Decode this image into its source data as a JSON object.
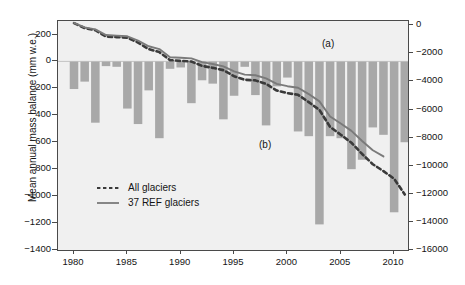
{
  "figure": {
    "background": "#ffffff",
    "plot_background": "#f0f0f0",
    "frame_color": "#4a4a4a"
  },
  "annotations": {
    "panel_a": "(a)",
    "panel_b": "(b)"
  },
  "legend": {
    "items": [
      {
        "label": "All glaciers",
        "style": "dashed",
        "color": "#3a3a3a"
      },
      {
        "label": "37 REF glaciers",
        "style": "solid",
        "color": "#7a7a7a"
      }
    ]
  },
  "chart_data": {
    "type": "bar",
    "title": "",
    "subtitle": "",
    "xlabel": "",
    "ylabel": "Mean annual mass balance (mm w.e.)",
    "y2label": "Cumulative annual mass balance (mm w.e.)",
    "xlim": [
      1979.0,
      2011.8
    ],
    "ylim": [
      -1400,
      300
    ],
    "y2lim": [
      -16000,
      300
    ],
    "grid": false,
    "legend_position": "center-left",
    "bar_color": "#a8a8a8",
    "xticks": [
      1980,
      1985,
      1990,
      1995,
      2000,
      2005,
      2010
    ],
    "xticklabels": [
      "1980",
      "1985",
      "1990",
      "1995",
      "2000",
      "2005",
      "2010"
    ],
    "yticks": [
      200,
      0,
      -200,
      -400,
      -600,
      -800,
      -1000,
      -1200,
      -1400
    ],
    "yticklabels": [
      "200",
      "0",
      "-200",
      "-400",
      "-600",
      "-800",
      "-1000",
      "-1200",
      "-1400"
    ],
    "y2ticks": [
      0,
      -2000,
      -4000,
      -6000,
      -8000,
      -10000,
      -12000,
      -14000,
      -16000
    ],
    "y2ticklabels": [
      "0",
      "-2000",
      "-4000",
      "-6000",
      "-8000",
      "-10000",
      "-12000",
      "-14000",
      "-16000"
    ],
    "categories": [
      1980,
      1981,
      1982,
      1983,
      1984,
      1985,
      1986,
      1987,
      1988,
      1989,
      1990,
      1991,
      1992,
      1993,
      1994,
      1995,
      1996,
      1997,
      1998,
      1999,
      2000,
      2001,
      2002,
      2003,
      2004,
      2005,
      2006,
      2007,
      2008,
      2009,
      2010,
      2011
    ],
    "values": [
      -205,
      -150,
      -455,
      -35,
      -40,
      -350,
      -465,
      -215,
      -570,
      -55,
      -45,
      -310,
      -140,
      -165,
      -430,
      -255,
      -40,
      -250,
      -475,
      -185,
      -120,
      -520,
      -555,
      -1210,
      -555,
      -570,
      -800,
      -730,
      -490,
      -545,
      -1120,
      -600
    ],
    "series": [
      {
        "name": "All glaciers",
        "style": "dashed",
        "color": "#3a3a3a",
        "axis": "right",
        "x": [
          1980,
          1981,
          1982,
          1983,
          1984,
          1985,
          1986,
          1987,
          1988,
          1989,
          1990,
          1991,
          1992,
          1993,
          1994,
          1995,
          1996,
          1997,
          1998,
          1999,
          2000,
          2001,
          2002,
          2003,
          2004,
          2005,
          2006,
          2007,
          2008,
          2009,
          2010,
          2011
        ],
        "values": [
          150,
          -205,
          -355,
          -810,
          -845,
          -885,
          -1235,
          -1700,
          -1915,
          -2485,
          -2540,
          -2585,
          -2895,
          -3035,
          -3200,
          -3630,
          -3885,
          -3925,
          -4175,
          -4650,
          -4835,
          -4955,
          -5475,
          -6030,
          -7240,
          -7795,
          -8365,
          -9165,
          -9895,
          -10385,
          -10930,
          -12050
        ]
      },
      {
        "name": "37 REF glaciers",
        "style": "solid",
        "color": "#7a7a7a",
        "axis": "right",
        "x": [
          1980,
          1981,
          1982,
          1983,
          1984,
          1985,
          1986,
          1987,
          1988,
          1989,
          1990,
          1991,
          1992,
          1993,
          1994,
          1995,
          1996,
          1997,
          1998,
          1999,
          2000,
          2001,
          2002,
          2003,
          2004,
          2005,
          2006,
          2007,
          2008,
          2009
        ],
        "values": [
          160,
          -150,
          -300,
          -700,
          -740,
          -790,
          -1090,
          -1500,
          -1700,
          -2280,
          -2320,
          -2360,
          -2630,
          -2760,
          -2930,
          -3290,
          -3520,
          -3560,
          -3780,
          -4180,
          -4340,
          -4450,
          -4900,
          -5420,
          -6500,
          -7000,
          -7520,
          -8240,
          -8900,
          -9340
        ]
      }
    ]
  }
}
